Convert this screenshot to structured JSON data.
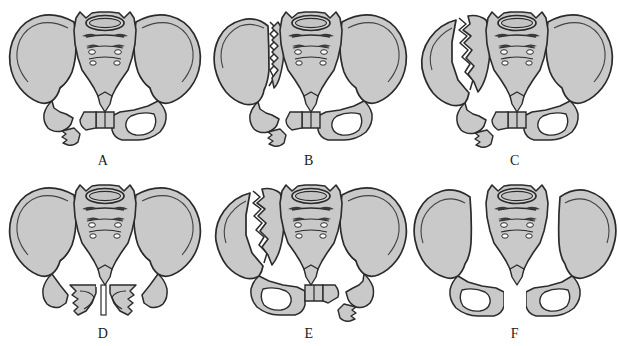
{
  "figure": {
    "background_color": "#ffffff",
    "bone_fill_color": "#c9c9c9",
    "bone_fill_light": "#d8d8d8",
    "bone_fill_shadow": "#b4b4b4",
    "outline_color": "#2b2b2b",
    "fracture_gap_color": "#ffffff",
    "label_color": "#1a1a1a",
    "panel_count": 6,
    "columns": 3,
    "rows": 2
  },
  "panels": [
    {
      "id": "panel-a",
      "label": "A",
      "column": 0,
      "row": 0,
      "description": "Intact iliac wings with fractures of the left superior and inferior pubic rami",
      "features": {
        "left_ilium_fracture": false,
        "right_ilium_fracture": false,
        "symphysis_diastasis": false,
        "left_rami_fracture": true,
        "right_rami_fracture": false,
        "si_joint_widening": false
      }
    },
    {
      "id": "panel-b",
      "label": "B",
      "column": 1,
      "row": 0,
      "description": "Vertical fracture through the left ilium adjacent to the sacroiliac joint with ipsilateral pubic rami fractures",
      "features": {
        "left_ilium_fracture": true,
        "left_ilium_fracture_position": "medial",
        "right_ilium_fracture": false,
        "symphysis_diastasis": false,
        "left_rami_fracture": true,
        "right_rami_fracture": false,
        "si_joint_widening": false
      }
    },
    {
      "id": "panel-c",
      "label": "C",
      "column": 2,
      "row": 0,
      "description": "Oblique fracture through the body of the left iliac wing with ipsilateral pubic rami fractures",
      "features": {
        "left_ilium_fracture": true,
        "left_ilium_fracture_position": "lateral-oblique",
        "right_ilium_fracture": false,
        "symphysis_diastasis": false,
        "left_rami_fracture": true,
        "right_rami_fracture": false,
        "si_joint_widening": false
      }
    },
    {
      "id": "panel-d",
      "label": "D",
      "column": 0,
      "row": 1,
      "description": "Open-book pattern with symphysis pubis diastasis and bilateral pubic rami fractures",
      "features": {
        "left_ilium_fracture": false,
        "right_ilium_fracture": false,
        "symphysis_diastasis": true,
        "left_rami_fracture": true,
        "right_rami_fracture": true,
        "si_joint_widening": false
      }
    },
    {
      "id": "panel-e",
      "label": "E",
      "column": 1,
      "row": 1,
      "description": "Left iliac wing fracture combined with contralateral right pubic rami fractures",
      "features": {
        "left_ilium_fracture": true,
        "left_ilium_fracture_position": "lateral-oblique",
        "right_ilium_fracture": false,
        "symphysis_diastasis": false,
        "left_rami_fracture": false,
        "right_rami_fracture": true,
        "si_joint_widening": false
      }
    },
    {
      "id": "panel-f",
      "label": "F",
      "column": 2,
      "row": 1,
      "description": "Bilateral sacroiliac joint disruption with separation of both hemipelves and symphysis diastasis",
      "features": {
        "left_ilium_fracture": false,
        "right_ilium_fracture": false,
        "symphysis_diastasis": true,
        "left_rami_fracture": false,
        "right_rami_fracture": false,
        "si_joint_widening": true,
        "si_joint_widening_side": "bilateral"
      }
    }
  ],
  "anatomy": {
    "sacrum_foramina_pairs": 3,
    "sacral_ridges": 3,
    "l5_body": true
  }
}
